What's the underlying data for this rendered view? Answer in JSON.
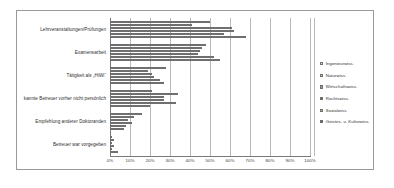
{
  "chart_data": {
    "type": "bar",
    "orientation": "horizontal",
    "title": "",
    "xlabel": "",
    "ylabel": "",
    "xlim": [
      0,
      100
    ],
    "grid": true,
    "legend_position": "right",
    "tick_labels": [
      "0%",
      "10%",
      "20%",
      "30%",
      "40%",
      "50%",
      "60%",
      "70%",
      "80%",
      "90%",
      "100%"
    ],
    "tick_values": [
      0,
      10,
      20,
      30,
      40,
      50,
      60,
      70,
      80,
      90,
      100
    ],
    "categories": [
      "Lehrveranstaltungen/Prüfungen",
      "Examensarbeit",
      "Tätigkeit als „HiWi“",
      "kannte Betreuer vorher nicht persönlich",
      "Empfehlung anderer Doktoranden",
      "Betreuer war vorgegeben"
    ],
    "series": [
      {
        "name": "Ingenieurwiss.",
        "color": "#e8e8e8",
        "values": [
          50,
          48,
          28,
          21,
          16,
          1
        ]
      },
      {
        "name": "Naturwiss.",
        "color": "#cfcfcf",
        "values": [
          41,
          46,
          19,
          34,
          12,
          2
        ]
      },
      {
        "name": "Wirtschaftswiss.",
        "color": "#9d9d9d",
        "values": [
          61,
          45,
          21,
          27,
          9,
          1
        ]
      },
      {
        "name": "Rechtswiss.",
        "color": "#6e6e6e",
        "values": [
          62,
          44,
          22,
          27,
          11,
          2
        ]
      },
      {
        "name": "Sozialwiss.",
        "color": "#bdbdbd",
        "values": [
          57,
          52,
          25,
          33,
          8,
          1
        ]
      },
      {
        "name": "Geistes- u. Kulturwiss.",
        "color": "#565656",
        "values": [
          68,
          55,
          27,
          20,
          7,
          4
        ]
      }
    ]
  }
}
